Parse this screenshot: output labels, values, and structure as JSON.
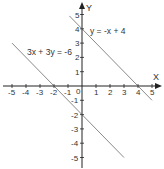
{
  "chart_data": {
    "type": "line",
    "title": "",
    "xlabel": "X",
    "ylabel": "Y",
    "xlim": [
      -5,
      5
    ],
    "ylim": [
      -5,
      5
    ],
    "grid": false,
    "x_ticks": [
      -5,
      -4,
      -3,
      -2,
      -1,
      0,
      1,
      2,
      3,
      4,
      5
    ],
    "y_ticks": [
      -5,
      -4,
      -3,
      -2,
      -1,
      1,
      2,
      3,
      4,
      5
    ],
    "origin_label": "0",
    "series": [
      {
        "name": "y = -x + 4",
        "equation": "y = -x + 4",
        "x": [
          -0.9,
          5.0
        ],
        "y": [
          4.9,
          -1.0
        ],
        "label_pos": [
          0.6,
          3.7
        ]
      },
      {
        "name": "3x + 3y = -6",
        "equation": "3x + 3y = -6",
        "x": [
          -5.0,
          3.0
        ],
        "y": [
          3.0,
          -5.0
        ],
        "label_pos": [
          -4.0,
          2.3
        ]
      }
    ],
    "colors": {
      "axis": "#222222",
      "line": "#8a8a8a",
      "text": "#333333"
    }
  },
  "labels": {
    "x_axis": "X",
    "y_axis": "Y",
    "eq1": "y = -x + 4",
    "eq2": "3x + 3y = -6",
    "origin": "0"
  }
}
